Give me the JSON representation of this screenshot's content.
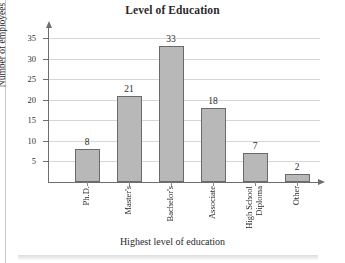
{
  "chart_data": {
    "type": "bar",
    "title": "Level of Education",
    "xlabel": "Highest level of education",
    "ylabel": "Number of employees",
    "categories": [
      "Ph.D.",
      "Master's",
      "Bachelor's",
      "Associate",
      "High School Diploma",
      "Other"
    ],
    "category_lines": [
      [
        "Ph.D."
      ],
      [
        "Master's"
      ],
      [
        "Bachelor's"
      ],
      [
        "Associate"
      ],
      [
        "High School",
        "Diploma"
      ],
      [
        "Other"
      ]
    ],
    "values": [
      8,
      21,
      33,
      18,
      7,
      2
    ],
    "value_labels": [
      "8",
      "21",
      "33",
      "18",
      "7",
      "2"
    ],
    "ylim": [
      0,
      37
    ],
    "yticks": [
      5,
      10,
      15,
      20,
      25,
      30,
      35
    ],
    "ytick_labels": [
      "5",
      "10",
      "15",
      "20",
      "25",
      "30",
      "35"
    ],
    "grid": "horizontal",
    "legend": "none",
    "bar_fill_color": "#b8b8b8",
    "bar_border_color": "#6a6a6a",
    "gridline_color": "#d7d7d7",
    "axis_color": "#6e6e6e"
  }
}
